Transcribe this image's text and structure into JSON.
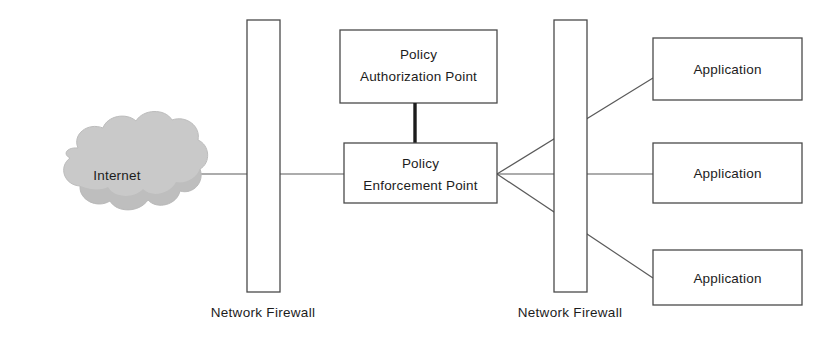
{
  "diagram": {
    "type": "network-architecture",
    "canvas": {
      "width": 834,
      "height": 338
    },
    "background_color": "#ffffff",
    "line_color": "#5a5a5a",
    "box_stroke_color": "#4a4a4a",
    "box_fill_color": "#ffffff",
    "cloud_fill_color": "#c9c9c9",
    "text_color": "#1c1c1c",
    "nodes": {
      "internet_cloud": {
        "label": "Internet",
        "shape": "cloud",
        "x": 117,
        "y": 175
      },
      "firewall_left": {
        "label": "Network Firewall",
        "shape": "tall-rectangle",
        "x": 247,
        "y": 20,
        "width": 33,
        "height": 272,
        "caption_y": 317
      },
      "policy_authorization_point": {
        "label_line_1": "Policy",
        "label_line_2": "Authorization Point",
        "shape": "rectangle",
        "x": 340,
        "y": 30,
        "width": 157,
        "height": 73
      },
      "policy_enforcement_point": {
        "label_line_1": "Policy",
        "label_line_2": "Enforcement Point",
        "shape": "rectangle",
        "x": 344,
        "y": 143,
        "width": 153,
        "height": 60
      },
      "firewall_right": {
        "label": "Network Firewall",
        "shape": "tall-rectangle",
        "x": 554,
        "y": 20,
        "width": 33,
        "height": 272,
        "caption_y": 317
      },
      "application_top": {
        "label": "Application",
        "shape": "rectangle",
        "x": 653,
        "y": 38,
        "width": 149,
        "height": 62
      },
      "application_middle": {
        "label": "Application",
        "shape": "rectangle",
        "x": 653,
        "y": 143,
        "width": 149,
        "height": 60
      },
      "application_bottom": {
        "label": "Application",
        "shape": "rectangle",
        "x": 653,
        "y": 250,
        "width": 149,
        "height": 55
      }
    },
    "connections": [
      {
        "name": "internet-to-firewall-left",
        "from": "internet_cloud",
        "to": "firewall_left",
        "style": "thin",
        "path": "M 200 174 L 247 174"
      },
      {
        "name": "firewall-left-to-policy-enforcement-point",
        "from": "firewall_left",
        "to": "policy_enforcement_point",
        "style": "thin",
        "path": "M 280 174 L 344 174"
      },
      {
        "name": "policy-authorization-to-enforcement",
        "from": "policy_authorization_point",
        "to": "policy_enforcement_point",
        "style": "thick",
        "path": "M 415 103 L 415 143"
      },
      {
        "name": "enforcement-to-application-top",
        "from": "policy_enforcement_point",
        "to": "application_top",
        "style": "thin",
        "path": "M 497 174 L 653 78"
      },
      {
        "name": "enforcement-to-application-middle",
        "from": "policy_enforcement_point",
        "to": "application_middle",
        "style": "thin",
        "path": "M 497 174 L 653 174"
      },
      {
        "name": "enforcement-to-application-bottom",
        "from": "policy_enforcement_point",
        "to": "application_bottom",
        "style": "thin",
        "path": "M 497 174 L 653 278"
      }
    ]
  }
}
